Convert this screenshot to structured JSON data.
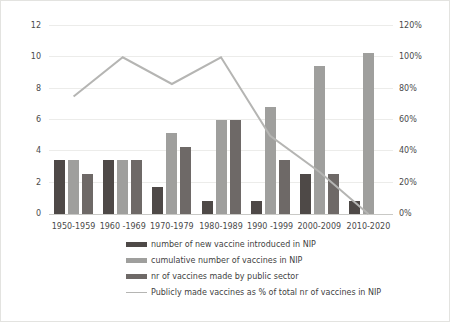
{
  "chart_data": {
    "type": "bar",
    "title": "",
    "categories": [
      "1950-1959",
      "1960 -1969",
      "1970-1979",
      "1980-1989",
      "1990 -1999",
      "2000-2009",
      "2010-2020"
    ],
    "series": [
      {
        "name": "number of new  vaccine introduced in NIP",
        "type": "bar",
        "color": "#4e4947",
        "values": [
          4,
          4,
          2,
          1,
          1,
          3,
          1
        ]
      },
      {
        "name": "cumulative number of vaccines in NIP",
        "type": "bar",
        "color": "#9f9f9d",
        "values": [
          4,
          4,
          6,
          7,
          8,
          11,
          12
        ]
      },
      {
        "name": "nr of vaccines made by public sector",
        "type": "bar",
        "color": "#6e6967",
        "values": [
          3,
          4,
          5,
          7,
          4,
          3,
          0
        ]
      },
      {
        "name": "Publicly made vaccines as % of total nr of vaccines in NIP",
        "type": "line",
        "color": "#b5b5b3",
        "axis": "right",
        "values": [
          75,
          100,
          83,
          100,
          50,
          27,
          0
        ]
      }
    ],
    "left_axis": {
      "min": 0,
      "max": 14,
      "ticks": [
        "0",
        "2",
        "4",
        "6",
        "8",
        "10",
        "12",
        "14"
      ]
    },
    "right_axis": {
      "min": 0,
      "max": 120,
      "ticks": [
        "0%",
        "20%",
        "40%",
        "60%",
        "80%",
        "100%",
        "120%"
      ]
    },
    "grid": true,
    "legend_position": "bottom"
  }
}
